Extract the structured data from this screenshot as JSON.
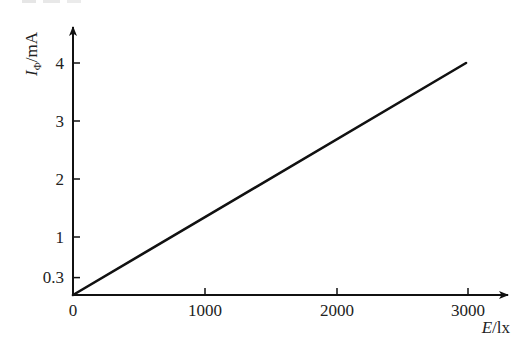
{
  "chart_data": {
    "type": "line",
    "title": "",
    "xlabel": "E/lx",
    "ylabel": "IΦ/mA",
    "ylabel_main": "I",
    "ylabel_sub": "Φ",
    "ylabel_unit": "/mA",
    "xlabel_var": "E",
    "xlabel_unit": "/lx",
    "xlim": [
      0,
      3000
    ],
    "ylim": [
      0,
      4
    ],
    "grid": false,
    "legend": null,
    "x_ticks": [
      0,
      1000,
      2000,
      3000
    ],
    "x_tick_labels": [
      "0",
      "1000",
      "2000",
      "3000"
    ],
    "y_ticks": [
      0.3,
      1,
      2,
      3,
      4
    ],
    "y_tick_labels": [
      "0.3",
      "1",
      "2",
      "3",
      "4"
    ],
    "origin_label": "0",
    "series": [
      {
        "name": "IΦ vs E",
        "x": [
          0,
          3000
        ],
        "y": [
          0,
          4.0
        ]
      }
    ],
    "color": "#111111"
  }
}
